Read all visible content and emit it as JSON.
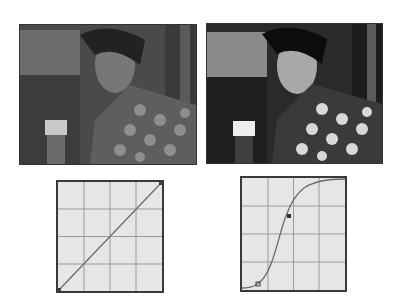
{
  "figure": {
    "panels": [
      {
        "id": "before",
        "photo_label": "original photo",
        "curve": "linear",
        "curve_points": [
          [
            0,
            0
          ],
          [
            1,
            1
          ]
        ],
        "control_points": []
      },
      {
        "id": "after",
        "photo_label": "contrast-enhanced photo",
        "curve": "s-curve",
        "curve_points": [
          [
            0,
            0
          ],
          [
            0.15,
            0.06
          ],
          [
            0.5,
            0.5
          ],
          [
            0.85,
            0.94
          ],
          [
            1,
            1
          ]
        ],
        "control_points": [
          [
            0.15,
            0.05
          ],
          [
            0.38,
            0.72
          ]
        ]
      }
    ],
    "grid_divisions": 4,
    "colors": {
      "curve_bg": "#e6e6e6",
      "grid": "#9a9a9a",
      "line": "#555555",
      "frame": "#3a3a3a"
    }
  }
}
